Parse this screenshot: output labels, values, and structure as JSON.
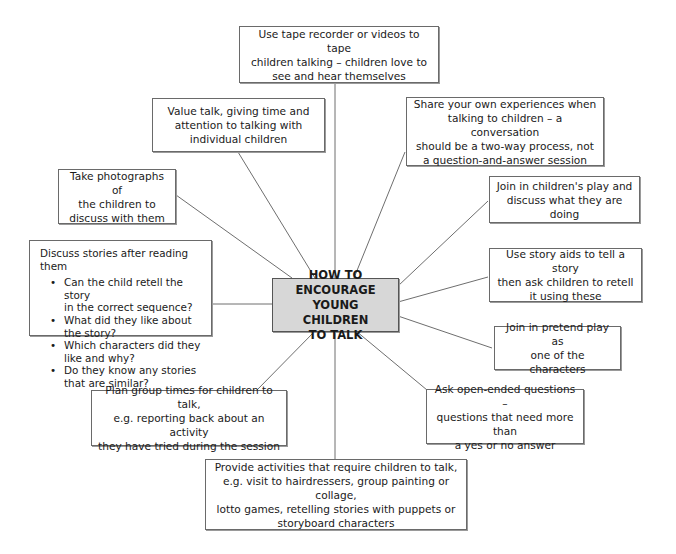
{
  "diagram": {
    "type": "spider-diagram",
    "center": {
      "lines": [
        "HOW TO ENCOURAGE",
        "YOUNG CHILDREN",
        "TO TALK"
      ],
      "fill": "#d7d7d7"
    },
    "nodes": [
      {
        "id": "tape",
        "lines": [
          "Use tape recorder or videos to tape",
          "children talking – children love to",
          "see and hear themselves"
        ]
      },
      {
        "id": "value",
        "lines": [
          "Value talk, giving time and",
          "attention to talking with",
          "individual children"
        ]
      },
      {
        "id": "share",
        "lines": [
          "Share your own experiences when",
          "talking to children – a conversation",
          "should be a two-way process, not",
          "a question-and-answer session"
        ]
      },
      {
        "id": "photos",
        "lines": [
          "Take photographs of",
          "the children to",
          "discuss with them"
        ]
      },
      {
        "id": "play",
        "lines": [
          "Join in children's play and",
          "discuss what they are doing"
        ]
      },
      {
        "id": "stories",
        "heading": "Discuss stories after reading them",
        "bullets": [
          [
            "Can the child retell the story",
            "in the correct sequence?"
          ],
          [
            "What did they like about",
            "the story?"
          ],
          [
            "Which characters did they",
            "like and why?"
          ],
          [
            "Do they know any stories",
            "that are similar?"
          ]
        ]
      },
      {
        "id": "aids",
        "lines": [
          "Use story aids to tell a story",
          "then ask children to retell",
          "it using these"
        ]
      },
      {
        "id": "pretend",
        "lines": [
          "Join in pretend play as",
          "one of the characters"
        ]
      },
      {
        "id": "open",
        "lines": [
          "Ask open-ended questions –",
          "questions that need more than",
          "a yes or no answer"
        ]
      },
      {
        "id": "group",
        "lines": [
          "Plan group times for children to talk,",
          "e.g. reporting back about an activity",
          "they have tried during the session"
        ]
      },
      {
        "id": "activities",
        "lines": [
          "Provide activities that require children to talk,",
          "e.g. visit to hairdressers, group painting or collage,",
          "lotto games, retelling stories with puppets or",
          "storyboard characters"
        ]
      }
    ]
  }
}
